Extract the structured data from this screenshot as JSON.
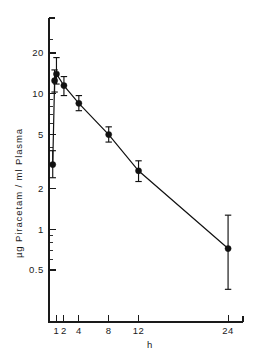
{
  "figure": {
    "background_color": "#ffffff",
    "ink_color": "#111111"
  },
  "chart_data": {
    "type": "scatter",
    "title": "",
    "subtitle": "",
    "xlabel": "h",
    "ylabel": "µg Piracetam / ml Plasma",
    "xscale": "linear",
    "yscale": "log",
    "xlim": [
      0,
      26
    ],
    "ylim": [
      0.33,
      26
    ],
    "grid": false,
    "legend": null,
    "legend_position": "none",
    "xticks": [
      1,
      2,
      4,
      8,
      12,
      24
    ],
    "xticklabels": [
      "1",
      "2",
      "4",
      "8",
      "12",
      "24"
    ],
    "yticks": [
      0.5,
      1,
      2,
      5,
      10,
      20
    ],
    "yticklabels": [
      "0.5",
      "1",
      "2",
      "5",
      "10",
      "20"
    ],
    "yminorticks": [
      0.6,
      0.7,
      0.8,
      0.9,
      3,
      4,
      6,
      7,
      8,
      9
    ],
    "marker": "filled-circle",
    "errorbars": "vertical-with-caps",
    "series": [
      {
        "name": "Piracetam plasma concentration",
        "x": [
          0.5,
          0.75,
          1.0,
          2.0,
          4.0,
          8.0,
          12.0,
          24.0
        ],
        "values": [
          3.0,
          12.5,
          14.0,
          11.5,
          8.5,
          5.0,
          2.7,
          0.72
        ],
        "yerr_low": [
          0.6,
          2.2,
          2.2,
          1.8,
          1.0,
          0.6,
          0.45,
          0.36
        ],
        "yerr_high": [
          0.8,
          2.5,
          4.5,
          1.9,
          1.2,
          0.7,
          0.5,
          0.55
        ]
      }
    ],
    "annotations": []
  }
}
